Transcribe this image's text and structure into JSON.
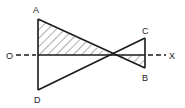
{
  "diagram": {
    "type": "geometry",
    "labels": {
      "A": "A",
      "B": "B",
      "C": "C",
      "D": "D",
      "O": "O",
      "X": "X"
    },
    "points": {
      "A": [
        38,
        19
      ],
      "D": [
        38,
        90
      ],
      "C": [
        145,
        38
      ],
      "B": [
        145,
        68
      ],
      "P": [
        112,
        55
      ]
    },
    "axis": {
      "from": "O",
      "to": "X",
      "style": "dashed-ends-solid-middle",
      "y": 55
    },
    "hatched_regions": [
      "A-axis-P upper-left triangle",
      "P-axis-B lower-right triangle"
    ],
    "colors": {
      "stroke": "#1a1a1a",
      "hatch": "#333333",
      "background": "#ffffff"
    }
  }
}
